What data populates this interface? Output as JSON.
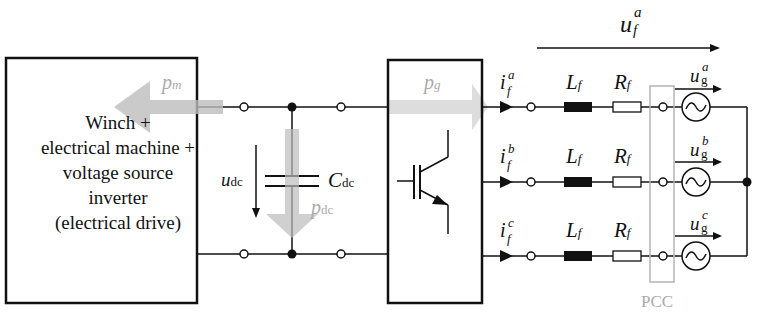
{
  "diagram": {
    "left_block": {
      "lines": [
        "Winch +",
        "electrical machine +",
        "voltage source",
        "inverter",
        "(electrical drive)"
      ]
    },
    "power_flows": {
      "pm": {
        "symbol": "p",
        "sub": "m"
      },
      "pdc": {
        "symbol": "p",
        "sub": "dc"
      },
      "pg": {
        "symbol": "p",
        "sub": "g"
      }
    },
    "dc_link": {
      "voltage": {
        "symbol": "u",
        "sub": "dc"
      },
      "capacitor": {
        "symbol": "C",
        "sub": "dc"
      }
    },
    "phases": [
      {
        "current": {
          "symbol": "i",
          "sup": "a",
          "sub": "f"
        },
        "inductor": {
          "symbol": "L",
          "sub": "f"
        },
        "resistor": {
          "symbol": "R",
          "sub": "f"
        },
        "grid_voltage": {
          "symbol": "u",
          "sup": "a",
          "sub": "g"
        }
      },
      {
        "current": {
          "symbol": "i",
          "sup": "b",
          "sub": "f"
        },
        "inductor": {
          "symbol": "L",
          "sub": "f"
        },
        "resistor": {
          "symbol": "R",
          "sub": "f"
        },
        "grid_voltage": {
          "symbol": "u",
          "sup": "b",
          "sub": "g"
        }
      },
      {
        "current": {
          "symbol": "i",
          "sup": "c",
          "sub": "f"
        },
        "inductor": {
          "symbol": "L",
          "sub": "f"
        },
        "resistor": {
          "symbol": "R",
          "sub": "f"
        },
        "grid_voltage": {
          "symbol": "u",
          "sup": "c",
          "sub": "g"
        }
      }
    ],
    "filter_voltage": {
      "symbol": "u",
      "sup": "a",
      "sub": "f"
    },
    "pcc_label": "PCC",
    "colors": {
      "line": "#111111",
      "power_arrow": "#c8c8c8",
      "pcc_box": "#b4b4b4"
    }
  }
}
